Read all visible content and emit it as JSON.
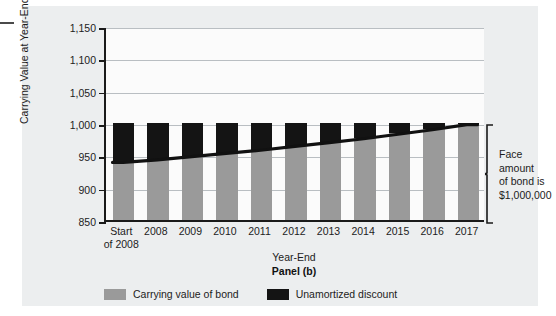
{
  "chart_data": {
    "type": "bar",
    "title": "",
    "panel_label": "Panel (b)",
    "xlabel": "Year-End",
    "ylabel": "Carrying Value at Year-End ($000)",
    "ylim": [
      850,
      1150
    ],
    "yticks": [
      850,
      900,
      950,
      1000,
      1050,
      1100,
      1150
    ],
    "ytick_labels": [
      "850",
      "900",
      "950",
      "1,000",
      "1,050",
      "1,100",
      "1,150"
    ],
    "grid": true,
    "legend_position": "bottom",
    "categories": [
      "Start of 2008",
      "2008",
      "2009",
      "2010",
      "2011",
      "2012",
      "2013",
      "2014",
      "2015",
      "2016",
      "2017"
    ],
    "category_lines": [
      [
        "Start",
        "of 2008"
      ],
      [
        "2008"
      ],
      [
        "2009"
      ],
      [
        "2010"
      ],
      [
        "2011"
      ],
      [
        "2012"
      ],
      [
        "2013"
      ],
      [
        "2014"
      ],
      [
        "2015"
      ],
      [
        "2016"
      ],
      [
        "2017"
      ]
    ],
    "bar_total": 1000,
    "series": [
      {
        "name": "Carrying value of bond",
        "color": "#9a9a9a",
        "values": [
          940,
          944,
          949,
          954,
          959,
          965,
          971,
          977,
          984,
          991,
          999
        ]
      },
      {
        "name": "Unamortized discount",
        "color": "#141414",
        "values": [
          60,
          56,
          51,
          46,
          41,
          35,
          29,
          23,
          16,
          9,
          1
        ]
      }
    ],
    "curve": {
      "name": "Carrying value curve",
      "color": "#111111",
      "values": [
        940,
        944,
        949,
        954,
        959,
        965,
        971,
        977,
        984,
        991,
        999
      ]
    },
    "annotation": {
      "lines": [
        "Face",
        "amount",
        "of bond is",
        "$1,000,000"
      ],
      "text": "Face amount of bond is $1,000,000",
      "brace_from": 850,
      "brace_to": 1000
    }
  },
  "legend": {
    "items": [
      {
        "label": "Carrying value of bond",
        "color": "#9a9a9a"
      },
      {
        "label": "Unamortized discount",
        "color": "#141414"
      }
    ]
  },
  "colors": {
    "carrying": "#9a9a9a",
    "discount": "#141414",
    "card_background": "#eceeef",
    "plot_background": "#fbfbfb",
    "axis": "#1a1a1a",
    "gridline": "#b9bec2"
  }
}
